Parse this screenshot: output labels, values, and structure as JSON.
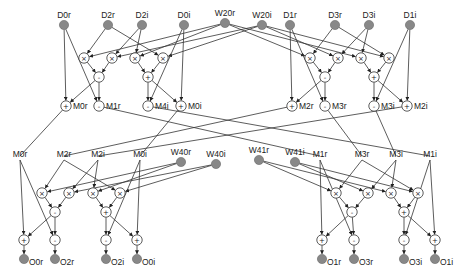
{
  "diagram": {
    "type": "FFT butterfly dataflow graph",
    "colors": {
      "io_node": "#888888",
      "wire": "#333333",
      "op_node_fill": "#ffffff"
    },
    "stage1": {
      "inputs": [
        {
          "id": "D0r",
          "label": "D0r",
          "x": 64,
          "y": 25
        },
        {
          "id": "D2r",
          "label": "D2r",
          "x": 108,
          "y": 25
        },
        {
          "id": "D2i",
          "label": "D2i",
          "x": 142,
          "y": 25
        },
        {
          "id": "D0i",
          "label": "D0i",
          "x": 184,
          "y": 25
        },
        {
          "id": "W20r",
          "label": "W20r",
          "x": 225,
          "y": 23
        },
        {
          "id": "W20i",
          "label": "W20i",
          "x": 262,
          "y": 25
        },
        {
          "id": "D1r",
          "label": "D1r",
          "x": 290,
          "y": 25
        },
        {
          "id": "D3r",
          "label": "D3r",
          "x": 335,
          "y": 25
        },
        {
          "id": "D3i",
          "label": "D3i",
          "x": 369,
          "y": 25
        },
        {
          "id": "D1i",
          "label": "D1i",
          "x": 410,
          "y": 25
        }
      ],
      "ops": [
        {
          "id": "m1",
          "sym": "×",
          "x": 84,
          "y": 58
        },
        {
          "id": "m2",
          "sym": "×",
          "x": 112,
          "y": 58
        },
        {
          "id": "m3",
          "sym": "×",
          "x": 135,
          "y": 58
        },
        {
          "id": "m4",
          "sym": "×",
          "x": 163,
          "y": 58
        },
        {
          "id": "m5",
          "sym": "×",
          "x": 310,
          "y": 58
        },
        {
          "id": "m6",
          "sym": "×",
          "x": 338,
          "y": 58
        },
        {
          "id": "m7",
          "sym": "×",
          "x": 361,
          "y": 58
        },
        {
          "id": "m8",
          "sym": "×",
          "x": 389,
          "y": 58
        },
        {
          "id": "s1",
          "sym": "-",
          "x": 99,
          "y": 77
        },
        {
          "id": "a1",
          "sym": "+",
          "x": 148,
          "y": 77
        },
        {
          "id": "s2",
          "sym": "-",
          "x": 325,
          "y": 77
        },
        {
          "id": "a2",
          "sym": "+",
          "x": 374,
          "y": 77
        },
        {
          "id": "M0r",
          "sym": "+",
          "x": 66,
          "y": 106,
          "label": "M0r"
        },
        {
          "id": "M1r",
          "sym": "-",
          "x": 99,
          "y": 106,
          "label": "M1r"
        },
        {
          "id": "M4i",
          "sym": "-",
          "x": 148,
          "y": 106,
          "label": "M4i"
        },
        {
          "id": "M0i",
          "sym": "+",
          "x": 181,
          "y": 106,
          "label": "M0i"
        },
        {
          "id": "M2r",
          "sym": "+",
          "x": 292,
          "y": 106,
          "label": "M2r"
        },
        {
          "id": "M3r",
          "sym": "-",
          "x": 325,
          "y": 106,
          "label": "M3r"
        },
        {
          "id": "M3i",
          "sym": "-",
          "x": 374,
          "y": 106,
          "label": "M3i"
        },
        {
          "id": "M2i",
          "sym": "+",
          "x": 407,
          "y": 106,
          "label": "M2i"
        }
      ]
    },
    "stage2": {
      "labels": [
        {
          "id": "L_M0r",
          "label": "M0r",
          "x": 20,
          "y": 157
        },
        {
          "id": "L_M2r",
          "label": "M2r",
          "x": 64,
          "y": 157
        },
        {
          "id": "L_M2i",
          "label": "M2i",
          "x": 98,
          "y": 157
        },
        {
          "id": "L_M0i",
          "label": "M0i",
          "x": 140,
          "y": 157
        },
        {
          "id": "L_M1r",
          "label": "M1r",
          "x": 320,
          "y": 157
        },
        {
          "id": "L_M3r",
          "label": "M3r",
          "x": 362,
          "y": 157
        },
        {
          "id": "L_M3i",
          "label": "M3i",
          "x": 396,
          "y": 157
        },
        {
          "id": "L_M1i",
          "label": "M1i",
          "x": 430,
          "y": 157
        }
      ],
      "twiddles": [
        {
          "id": "W40r",
          "label": "W40r",
          "x": 181,
          "y": 162
        },
        {
          "id": "W40i",
          "label": "W40i",
          "x": 216,
          "y": 164
        },
        {
          "id": "W41r",
          "label": "W41r",
          "x": 259,
          "y": 160
        },
        {
          "id": "W41i",
          "label": "W41i",
          "x": 295,
          "y": 162
        }
      ],
      "ops": [
        {
          "id": "bm1",
          "sym": "×",
          "x": 42,
          "y": 193
        },
        {
          "id": "bm2",
          "sym": "×",
          "x": 69,
          "y": 193
        },
        {
          "id": "bm3",
          "sym": "×",
          "x": 93,
          "y": 193
        },
        {
          "id": "bm4",
          "sym": "×",
          "x": 120,
          "y": 193
        },
        {
          "id": "bm5",
          "sym": "×",
          "x": 336,
          "y": 193
        },
        {
          "id": "bm6",
          "sym": "×",
          "x": 368,
          "y": 193
        },
        {
          "id": "bm7",
          "sym": "×",
          "x": 391,
          "y": 193
        },
        {
          "id": "bm8",
          "sym": "×",
          "x": 418,
          "y": 193
        },
        {
          "id": "bs1",
          "sym": "-",
          "x": 55,
          "y": 212
        },
        {
          "id": "ba1",
          "sym": "+",
          "x": 106,
          "y": 212
        },
        {
          "id": "bs2",
          "sym": "-",
          "x": 352,
          "y": 212
        },
        {
          "id": "ba2",
          "sym": "+",
          "x": 404,
          "y": 212
        },
        {
          "id": "f1",
          "sym": "+",
          "x": 24,
          "y": 240
        },
        {
          "id": "f2",
          "sym": "-",
          "x": 55,
          "y": 240
        },
        {
          "id": "f3",
          "sym": "-",
          "x": 106,
          "y": 240
        },
        {
          "id": "f4",
          "sym": "+",
          "x": 137,
          "y": 240
        },
        {
          "id": "f5",
          "sym": "+",
          "x": 322,
          "y": 240
        },
        {
          "id": "f6",
          "sym": "-",
          "x": 354,
          "y": 240
        },
        {
          "id": "f7",
          "sym": "-",
          "x": 404,
          "y": 240
        },
        {
          "id": "f8",
          "sym": "+",
          "x": 435,
          "y": 240
        }
      ],
      "outputs": [
        {
          "id": "O0r",
          "label": "O0r",
          "x": 24,
          "y": 259
        },
        {
          "id": "O2r",
          "label": "O2r",
          "x": 55,
          "y": 259
        },
        {
          "id": "O2i",
          "label": "O2i",
          "x": 106,
          "y": 259
        },
        {
          "id": "O0i",
          "label": "O0i",
          "x": 137,
          "y": 259
        },
        {
          "id": "O1r",
          "label": "O1r",
          "x": 322,
          "y": 259
        },
        {
          "id": "O3r",
          "label": "O3r",
          "x": 354,
          "y": 259
        },
        {
          "id": "O3i",
          "label": "O3i",
          "x": 404,
          "y": 259
        },
        {
          "id": "O1i",
          "label": "O1i",
          "x": 435,
          "y": 259
        }
      ]
    },
    "edges": [
      [
        "D2r",
        "m1"
      ],
      [
        "W20r",
        "m1"
      ],
      [
        "D2i",
        "m2"
      ],
      [
        "W20i",
        "m2"
      ],
      [
        "D2i",
        "m3"
      ],
      [
        "W20r",
        "m3"
      ],
      [
        "D2r",
        "m4"
      ],
      [
        "W20i",
        "m4"
      ],
      [
        "m1",
        "s1"
      ],
      [
        "m2",
        "s1"
      ],
      [
        "m3",
        "a1"
      ],
      [
        "m4",
        "a1"
      ],
      [
        "D0r",
        "M0r"
      ],
      [
        "s1",
        "M0r"
      ],
      [
        "D0r",
        "M1r"
      ],
      [
        "s1",
        "M1r"
      ],
      [
        "a1",
        "M4i"
      ],
      [
        "D0i",
        "M4i"
      ],
      [
        "a1",
        "M0i"
      ],
      [
        "D0i",
        "M0i"
      ],
      [
        "D3r",
        "m5"
      ],
      [
        "W20r",
        "m5"
      ],
      [
        "D3i",
        "m6"
      ],
      [
        "W20i",
        "m6"
      ],
      [
        "D3i",
        "m7"
      ],
      [
        "W20r",
        "m7"
      ],
      [
        "D3r",
        "m8"
      ],
      [
        "W20i",
        "m8"
      ],
      [
        "m5",
        "s2"
      ],
      [
        "m6",
        "s2"
      ],
      [
        "m7",
        "a2"
      ],
      [
        "m8",
        "a2"
      ],
      [
        "D1r",
        "M2r"
      ],
      [
        "s2",
        "M2r"
      ],
      [
        "D1r",
        "M3r"
      ],
      [
        "s2",
        "M3r"
      ],
      [
        "a2",
        "M3i"
      ],
      [
        "D1i",
        "M3i"
      ],
      [
        "a2",
        "M2i"
      ],
      [
        "D1i",
        "M2i"
      ],
      [
        "L_M2r",
        "bm1"
      ],
      [
        "W40r",
        "bm1"
      ],
      [
        "L_M2i",
        "bm2"
      ],
      [
        "W40i",
        "bm2"
      ],
      [
        "L_M2i",
        "bm3"
      ],
      [
        "W40r",
        "bm3"
      ],
      [
        "L_M2r",
        "bm4"
      ],
      [
        "W40i",
        "bm4"
      ],
      [
        "bm1",
        "bs1"
      ],
      [
        "bm2",
        "bs1"
      ],
      [
        "bm3",
        "ba1"
      ],
      [
        "bm4",
        "ba1"
      ],
      [
        "L_M0r",
        "f1"
      ],
      [
        "bs1",
        "f1"
      ],
      [
        "L_M0r",
        "f2"
      ],
      [
        "bs1",
        "f2"
      ],
      [
        "ba1",
        "f3"
      ],
      [
        "L_M0i",
        "f3"
      ],
      [
        "ba1",
        "f4"
      ],
      [
        "L_M0i",
        "f4"
      ],
      [
        "f1",
        "O0r"
      ],
      [
        "f2",
        "O2r"
      ],
      [
        "f3",
        "O2i"
      ],
      [
        "f4",
        "O0i"
      ],
      [
        "L_M3r",
        "bm5"
      ],
      [
        "W41r",
        "bm5"
      ],
      [
        "L_M3i",
        "bm6"
      ],
      [
        "W41i",
        "bm6"
      ],
      [
        "L_M3i",
        "bm7"
      ],
      [
        "W41r",
        "bm7"
      ],
      [
        "L_M3r",
        "bm8"
      ],
      [
        "W41i",
        "bm8"
      ],
      [
        "bm5",
        "bs2"
      ],
      [
        "bm6",
        "bs2"
      ],
      [
        "bm7",
        "ba2"
      ],
      [
        "bm8",
        "ba2"
      ],
      [
        "L_M1r",
        "f5"
      ],
      [
        "bs2",
        "f5"
      ],
      [
        "L_M1r",
        "f6"
      ],
      [
        "bs2",
        "f6"
      ],
      [
        "ba2",
        "f7"
      ],
      [
        "L_M1i",
        "f7"
      ],
      [
        "ba2",
        "f8"
      ],
      [
        "L_M1i",
        "f8"
      ],
      [
        "f5",
        "O1r"
      ],
      [
        "f6",
        "O3r"
      ],
      [
        "f7",
        "O3i"
      ],
      [
        "f8",
        "O1i"
      ]
    ],
    "cross_edges": [
      [
        "M0r",
        "L_M0r"
      ],
      [
        "M1r",
        "L_M1r"
      ],
      [
        "M4i",
        "L_M1i"
      ],
      [
        "M0i",
        "L_M0i"
      ],
      [
        "M2r",
        "L_M2r"
      ],
      [
        "M3r",
        "L_M3r"
      ],
      [
        "M3i",
        "L_M3i"
      ],
      [
        "M2i",
        "L_M2i"
      ]
    ]
  }
}
